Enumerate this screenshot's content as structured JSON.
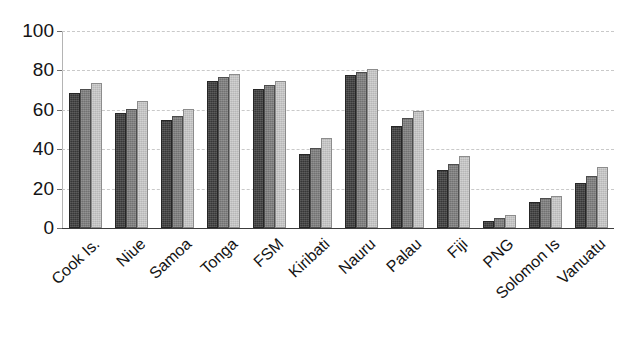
{
  "chart_data": {
    "type": "bar",
    "title": "",
    "subtitle": "",
    "xlabel": "",
    "ylabel": "",
    "ylim": [
      0,
      100
    ],
    "yticks": [
      0,
      20,
      40,
      60,
      80,
      100
    ],
    "ytick_labels": [
      "0",
      "20",
      "40",
      "60",
      "80",
      "100"
    ],
    "grid": true,
    "grid_style": "dashed-horizontal",
    "legend": "none",
    "legend_position": "none",
    "orientation": "vertical",
    "grouping": "grouped",
    "categories": [
      "Cook Is.",
      "Niue",
      "Samoa",
      "Tonga",
      "FSM",
      "Kiribati",
      "Nauru",
      "Palau",
      "Fiji",
      "PNG",
      "Solomon Is",
      "Vanuatu"
    ],
    "series": [
      {
        "name": "series-1",
        "color": "#3c3c3c",
        "values": [
          68.5,
          58.5,
          55.0,
          74.5,
          70.5,
          37.5,
          77.5,
          52.0,
          29.5,
          3.5,
          13.0,
          23.0
        ]
      },
      {
        "name": "series-2",
        "color": "#7d7d7d",
        "values": [
          70.5,
          60.5,
          57.0,
          76.5,
          72.5,
          40.5,
          79.0,
          56.0,
          32.5,
          5.0,
          15.0,
          26.5
        ]
      },
      {
        "name": "series-3",
        "color": "#c9c9c9",
        "values": [
          73.5,
          64.5,
          60.5,
          78.0,
          74.5,
          45.5,
          80.5,
          59.5,
          36.5,
          6.5,
          16.5,
          31.0
        ]
      }
    ]
  },
  "axes": {
    "y_tick_labels": [
      "100",
      "80",
      "60",
      "40",
      "20",
      "0"
    ],
    "x_tick_labels": [
      "Cook Is.",
      "Niue",
      "Samoa",
      "Tonga",
      "FSM",
      "Kiribati",
      "Nauru",
      "Palau",
      "Fiji",
      "PNG",
      "Solomon Is",
      "Vanuatu"
    ]
  },
  "colors": {
    "series_1": "#3c3c3c",
    "series_2": "#7d7d7d",
    "series_3": "#c9c9c9",
    "gridline": "#c9c9c9",
    "axis": "#3c3c3c",
    "text": "#141414",
    "background": "#ffffff"
  }
}
